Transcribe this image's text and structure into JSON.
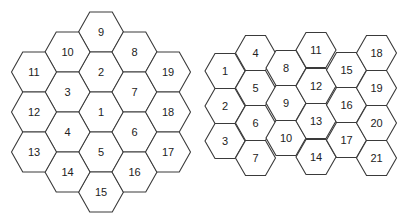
{
  "diagram": {
    "clusters": [
      {
        "name": "left-cluster-19-cells",
        "orientation": "flat-top",
        "hex_width": 45,
        "hex_height": 40,
        "cells": [
          {
            "label": "9",
            "cx": 101,
            "cy": 32
          },
          {
            "label": "2",
            "cx": 101,
            "cy": 72
          },
          {
            "label": "1",
            "cx": 101,
            "cy": 112
          },
          {
            "label": "5",
            "cx": 101,
            "cy": 152
          },
          {
            "label": "15",
            "cx": 101,
            "cy": 192
          },
          {
            "label": "10",
            "cx": 67.5,
            "cy": 52
          },
          {
            "label": "3",
            "cx": 67.5,
            "cy": 92
          },
          {
            "label": "4",
            "cx": 67.5,
            "cy": 132
          },
          {
            "label": "14",
            "cx": 67.5,
            "cy": 172
          },
          {
            "label": "8",
            "cx": 134.5,
            "cy": 52
          },
          {
            "label": "7",
            "cx": 134.5,
            "cy": 92
          },
          {
            "label": "6",
            "cx": 134.5,
            "cy": 132
          },
          {
            "label": "16",
            "cx": 134.5,
            "cy": 172
          },
          {
            "label": "11",
            "cx": 34,
            "cy": 72
          },
          {
            "label": "12",
            "cx": 34,
            "cy": 112
          },
          {
            "label": "13",
            "cx": 34,
            "cy": 152
          },
          {
            "label": "19",
            "cx": 168,
            "cy": 72
          },
          {
            "label": "18",
            "cx": 168,
            "cy": 112
          },
          {
            "label": "17",
            "cx": 168,
            "cy": 152
          }
        ]
      },
      {
        "name": "right-cluster-21-cells",
        "orientation": "flat-top",
        "hex_width": 40,
        "hex_height": 35,
        "cells": [
          {
            "label": "1",
            "cx": 225,
            "cy": 71
          },
          {
            "label": "2",
            "cx": 225,
            "cy": 106
          },
          {
            "label": "3",
            "cx": 225,
            "cy": 141
          },
          {
            "label": "4",
            "cx": 255.5,
            "cy": 53
          },
          {
            "label": "5",
            "cx": 255.5,
            "cy": 88
          },
          {
            "label": "6",
            "cx": 255.5,
            "cy": 123
          },
          {
            "label": "7",
            "cx": 255.5,
            "cy": 158
          },
          {
            "label": "8",
            "cx": 286,
            "cy": 68
          },
          {
            "label": "9",
            "cx": 286,
            "cy": 103
          },
          {
            "label": "10",
            "cx": 286,
            "cy": 138
          },
          {
            "label": "11",
            "cx": 316,
            "cy": 50
          },
          {
            "label": "12",
            "cx": 316,
            "cy": 86
          },
          {
            "label": "13",
            "cx": 316,
            "cy": 121
          },
          {
            "label": "14",
            "cx": 316,
            "cy": 157
          },
          {
            "label": "15",
            "cx": 346.5,
            "cy": 70
          },
          {
            "label": "16",
            "cx": 346.5,
            "cy": 105
          },
          {
            "label": "17",
            "cx": 346.5,
            "cy": 140
          },
          {
            "label": "18",
            "cx": 376.5,
            "cy": 53
          },
          {
            "label": "19",
            "cx": 376.5,
            "cy": 88
          },
          {
            "label": "20",
            "cx": 376.5,
            "cy": 123
          },
          {
            "label": "21",
            "cx": 376.5,
            "cy": 158
          }
        ]
      }
    ]
  }
}
